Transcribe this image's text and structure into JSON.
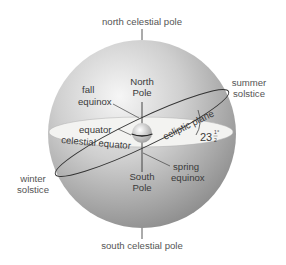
{
  "diagram": {
    "type": "celestial-sphere",
    "colors": {
      "sphere_highlight": "#f4f4f4",
      "sphere_shadow": "#8f8f8f",
      "equator_disk": "#f3f3f1",
      "line": "#333333",
      "text": "#3a3a3a"
    },
    "labels": {
      "north_celestial_pole": "north celestial pole",
      "south_celestial_pole": "south celestial pole",
      "summer_solstice_1": "summer",
      "summer_solstice_2": "solstice",
      "winter_solstice_1": "winter",
      "winter_solstice_2": "solstice",
      "fall_equinox_1": "fall",
      "fall_equinox_2": "equinox",
      "spring_equinox_1": "spring",
      "spring_equinox_2": "equinox",
      "north_pole_1": "North",
      "north_pole_2": "Pole",
      "south_pole_1": "South",
      "south_pole_2": "Pole",
      "equator": "equator",
      "celestial_equator": "celestial equator",
      "ecliptic_plane": "ecliptic plane",
      "tilt_whole": "23",
      "tilt_num": "1",
      "tilt_den": "2",
      "tilt_deg": "°"
    }
  }
}
